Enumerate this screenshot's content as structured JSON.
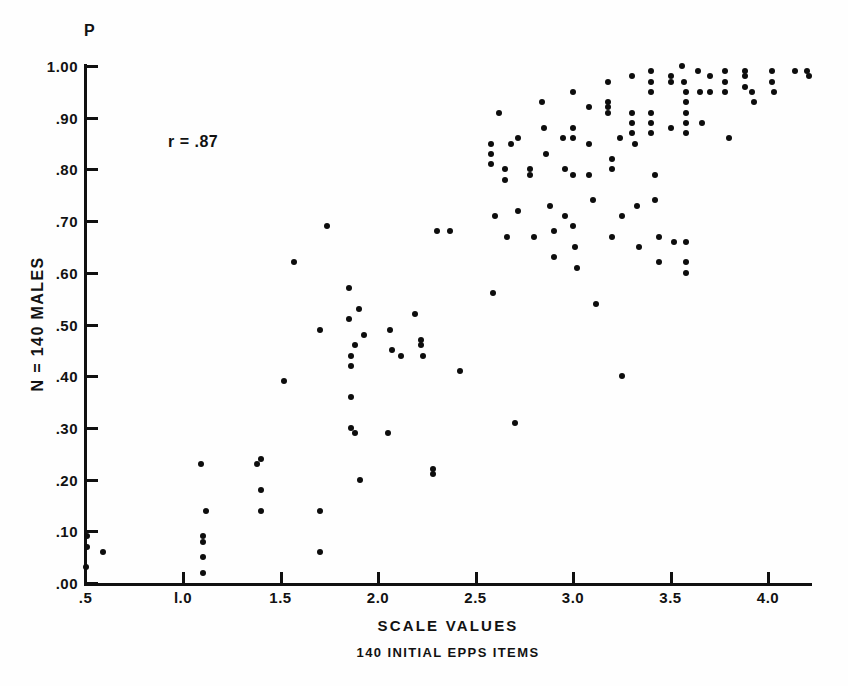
{
  "figure": {
    "p_symbol": "P",
    "r_annotation": "r = .87",
    "caption": "140 INITIAL EPPS ITEMS"
  },
  "chart_data": {
    "type": "scatter",
    "title": "",
    "subtitle": "140 INITIAL EPPS ITEMS",
    "xlabel": "SCALE VALUES",
    "ylabel": "N = 140 MALES",
    "y_axis_symbol": "P",
    "annotation": "r = .87",
    "correlation_r": 0.87,
    "n": 140,
    "grid": false,
    "legend": "none",
    "xlim": [
      0.5,
      4.25
    ],
    "ylim": [
      0.0,
      1.0
    ],
    "xticks": [
      0.5,
      1.0,
      1.5,
      2.0,
      2.5,
      3.0,
      3.5,
      4.0
    ],
    "xtick_labels": [
      ".5",
      "l.0",
      "1.5",
      "2.0",
      "2.5",
      "3.0",
      "3.5",
      "4.0"
    ],
    "yticks": [
      0.0,
      0.1,
      0.2,
      0.3,
      0.4,
      0.5,
      0.6,
      0.7,
      0.8,
      0.9,
      1.0
    ],
    "ytick_labels": [
      ".00",
      ".10",
      ".20",
      ".30",
      ".40",
      ".50",
      ".60",
      ".70",
      ".80",
      ".90",
      "1.00"
    ],
    "point_color": "#0d0d0d",
    "point_size_px": 6,
    "points": [
      [
        0.5,
        0.03
      ],
      [
        0.51,
        0.09
      ],
      [
        0.51,
        0.07
      ],
      [
        0.59,
        0.06
      ],
      [
        1.1,
        0.05
      ],
      [
        1.1,
        0.02
      ],
      [
        1.1,
        0.09
      ],
      [
        1.1,
        0.08
      ],
      [
        1.12,
        0.14
      ],
      [
        1.09,
        0.23
      ],
      [
        1.38,
        0.23
      ],
      [
        1.4,
        0.18
      ],
      [
        1.4,
        0.14
      ],
      [
        1.4,
        0.24
      ],
      [
        1.52,
        0.39
      ],
      [
        1.57,
        0.62
      ],
      [
        1.7,
        0.49
      ],
      [
        1.7,
        0.06
      ],
      [
        1.7,
        0.14
      ],
      [
        1.74,
        0.69
      ],
      [
        1.85,
        0.57
      ],
      [
        1.85,
        0.51
      ],
      [
        1.86,
        0.44
      ],
      [
        1.86,
        0.42
      ],
      [
        1.86,
        0.36
      ],
      [
        1.86,
        0.3
      ],
      [
        1.88,
        0.29
      ],
      [
        1.88,
        0.46
      ],
      [
        1.9,
        0.53
      ],
      [
        1.91,
        0.2
      ],
      [
        1.93,
        0.48
      ],
      [
        2.05,
        0.29
      ],
      [
        2.06,
        0.49
      ],
      [
        2.07,
        0.45
      ],
      [
        2.12,
        0.44
      ],
      [
        2.19,
        0.52
      ],
      [
        2.22,
        0.47
      ],
      [
        2.22,
        0.46
      ],
      [
        2.23,
        0.44
      ],
      [
        2.28,
        0.22
      ],
      [
        2.28,
        0.21
      ],
      [
        2.3,
        0.68
      ],
      [
        2.37,
        0.68
      ],
      [
        2.42,
        0.41
      ],
      [
        2.58,
        0.85
      ],
      [
        2.58,
        0.83
      ],
      [
        2.58,
        0.81
      ],
      [
        2.59,
        0.56
      ],
      [
        2.6,
        0.71
      ],
      [
        2.62,
        0.91
      ],
      [
        2.65,
        0.8
      ],
      [
        2.65,
        0.78
      ],
      [
        2.66,
        0.67
      ],
      [
        2.68,
        0.85
      ],
      [
        2.7,
        0.31
      ],
      [
        2.72,
        0.86
      ],
      [
        2.72,
        0.72
      ],
      [
        2.78,
        0.8
      ],
      [
        2.78,
        0.79
      ],
      [
        2.8,
        0.67
      ],
      [
        2.84,
        0.93
      ],
      [
        2.85,
        0.88
      ],
      [
        2.86,
        0.83
      ],
      [
        2.88,
        0.73
      ],
      [
        2.9,
        0.63
      ],
      [
        2.9,
        0.68
      ],
      [
        2.95,
        0.86
      ],
      [
        2.96,
        0.8
      ],
      [
        2.96,
        0.71
      ],
      [
        3.0,
        0.95
      ],
      [
        3.0,
        0.88
      ],
      [
        3.0,
        0.86
      ],
      [
        3.0,
        0.79
      ],
      [
        3.0,
        0.69
      ],
      [
        3.01,
        0.65
      ],
      [
        3.02,
        0.61
      ],
      [
        3.08,
        0.92
      ],
      [
        3.08,
        0.85
      ],
      [
        3.08,
        0.79
      ],
      [
        3.1,
        0.74
      ],
      [
        3.12,
        0.54
      ],
      [
        3.18,
        0.97
      ],
      [
        3.18,
        0.93
      ],
      [
        3.18,
        0.92
      ],
      [
        3.18,
        0.91
      ],
      [
        3.2,
        0.82
      ],
      [
        3.2,
        0.8
      ],
      [
        3.2,
        0.67
      ],
      [
        3.24,
        0.86
      ],
      [
        3.25,
        0.71
      ],
      [
        3.25,
        0.4
      ],
      [
        3.3,
        0.98
      ],
      [
        3.3,
        0.91
      ],
      [
        3.3,
        0.89
      ],
      [
        3.3,
        0.87
      ],
      [
        3.32,
        0.85
      ],
      [
        3.33,
        0.73
      ],
      [
        3.34,
        0.65
      ],
      [
        3.4,
        0.99
      ],
      [
        3.4,
        0.97
      ],
      [
        3.4,
        0.95
      ],
      [
        3.4,
        0.91
      ],
      [
        3.4,
        0.89
      ],
      [
        3.4,
        0.87
      ],
      [
        3.42,
        0.79
      ],
      [
        3.42,
        0.74
      ],
      [
        3.44,
        0.67
      ],
      [
        3.44,
        0.62
      ],
      [
        3.5,
        0.98
      ],
      [
        3.5,
        0.97
      ],
      [
        3.5,
        0.88
      ],
      [
        3.52,
        0.66
      ],
      [
        3.56,
        1.0
      ],
      [
        3.57,
        0.97
      ],
      [
        3.58,
        0.95
      ],
      [
        3.58,
        0.93
      ],
      [
        3.58,
        0.91
      ],
      [
        3.58,
        0.89
      ],
      [
        3.58,
        0.87
      ],
      [
        3.58,
        0.66
      ],
      [
        3.58,
        0.62
      ],
      [
        3.58,
        0.6
      ],
      [
        3.64,
        0.99
      ],
      [
        3.65,
        0.95
      ],
      [
        3.66,
        0.89
      ],
      [
        3.7,
        0.98
      ],
      [
        3.7,
        0.95
      ],
      [
        3.78,
        0.99
      ],
      [
        3.78,
        0.97
      ],
      [
        3.78,
        0.95
      ],
      [
        3.8,
        0.86
      ],
      [
        3.88,
        0.99
      ],
      [
        3.88,
        0.98
      ],
      [
        3.88,
        0.96
      ],
      [
        3.92,
        0.95
      ],
      [
        3.93,
        0.93
      ],
      [
        4.02,
        0.99
      ],
      [
        4.02,
        0.97
      ],
      [
        4.03,
        0.95
      ],
      [
        4.14,
        0.99
      ],
      [
        4.2,
        0.99
      ],
      [
        4.21,
        0.98
      ]
    ]
  }
}
